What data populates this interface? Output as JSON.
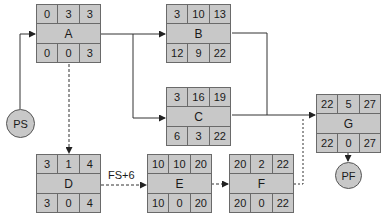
{
  "diagram": {
    "type": "precedence network (activity-on-node)",
    "node_layout": {
      "top_row": [
        "ES",
        "Duration",
        "EF"
      ],
      "bottom_row": [
        "LS",
        "Float",
        "LF"
      ]
    },
    "start": {
      "label": "PS"
    },
    "finish": {
      "label": "PF"
    },
    "nodes": {
      "A": {
        "label": "A",
        "top": [
          "0",
          "3",
          "3"
        ],
        "bottom": [
          "0",
          "0",
          "3"
        ]
      },
      "B": {
        "label": "B",
        "top": [
          "3",
          "10",
          "13"
        ],
        "bottom": [
          "12",
          "9",
          "22"
        ]
      },
      "C": {
        "label": "C",
        "top": [
          "3",
          "16",
          "19"
        ],
        "bottom": [
          "6",
          "3",
          "22"
        ]
      },
      "D": {
        "label": "D",
        "top": [
          "3",
          "1",
          "4"
        ],
        "bottom": [
          "3",
          "0",
          "4"
        ]
      },
      "E": {
        "label": "E",
        "top": [
          "10",
          "10",
          "20"
        ],
        "bottom": [
          "10",
          "0",
          "20"
        ]
      },
      "F": {
        "label": "F",
        "top": [
          "20",
          "2",
          "22"
        ],
        "bottom": [
          "20",
          "0",
          "22"
        ]
      },
      "G": {
        "label": "G",
        "top": [
          "22",
          "5",
          "27"
        ],
        "bottom": [
          "22",
          "0",
          "27"
        ]
      }
    },
    "edges": [
      {
        "from": "PS",
        "to": "A",
        "style": "solid"
      },
      {
        "from": "A",
        "to": "B",
        "style": "solid"
      },
      {
        "from": "A",
        "to": "C",
        "style": "solid"
      },
      {
        "from": "A",
        "to": "D",
        "style": "dashed"
      },
      {
        "from": "B",
        "to": "G",
        "style": "solid"
      },
      {
        "from": "C",
        "to": "G",
        "style": "solid"
      },
      {
        "from": "D",
        "to": "E",
        "style": "dashed",
        "label": "FS+6"
      },
      {
        "from": "E",
        "to": "F",
        "style": "dashed"
      },
      {
        "from": "F",
        "to": "G",
        "style": "dashed"
      },
      {
        "from": "G",
        "to": "PF",
        "style": "solid"
      }
    ],
    "lag_label": "FS+6"
  }
}
